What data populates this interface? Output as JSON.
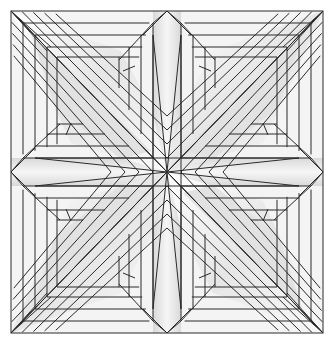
{
  "diagram": {
    "title": "",
    "type": "crease-pattern",
    "colors": {
      "background": "#ffffff",
      "line": "#2a2a2a",
      "fill_light": "#f4f4f4",
      "fill_mid": "#e2e2e2",
      "fill_dark": "#c8c8c8"
    },
    "bounds": {
      "x0": 11,
      "y0": 11,
      "x1": 323,
      "y1": 333
    },
    "center": {
      "x": 167,
      "y": 172
    },
    "edge_apexes": {
      "top": {
        "x": 167,
        "y": 11
      },
      "bottom": {
        "x": 167,
        "y": 333
      },
      "left": {
        "x": 11,
        "y": 172
      },
      "right": {
        "x": 323,
        "y": 172
      }
    },
    "frame_insets": [
      12,
      24,
      36,
      46
    ],
    "inner_square_insets": [
      62,
      74,
      86,
      98
    ],
    "diagonal_band_offsets": [
      0,
      14,
      28,
      42,
      56
    ],
    "labels": []
  }
}
